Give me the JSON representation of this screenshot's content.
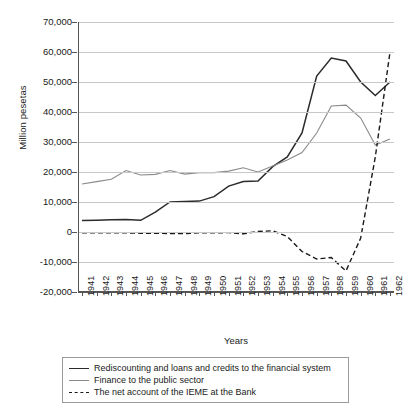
{
  "chart_data": {
    "type": "line",
    "title": "",
    "xlabel": "Years",
    "ylabel": "Million pesetas",
    "ylim": [
      -20000,
      70000
    ],
    "ytick_step": 10000,
    "grid": true,
    "legend_position": "bottom",
    "yticks": [
      "70,000",
      "60,000",
      "50,000",
      "40,000",
      "30,000",
      "20,000",
      "10,000",
      "0",
      "-10,000",
      "-20,000"
    ],
    "ytick_values": [
      70000,
      60000,
      50000,
      40000,
      30000,
      20000,
      10000,
      0,
      -10000,
      -20000
    ],
    "categories": [
      "1941",
      "1942",
      "1943",
      "1944",
      "1945",
      "1946",
      "1947",
      "1948",
      "1949",
      "1950",
      "1951",
      "1952",
      "1953",
      "1954",
      "1955",
      "1956",
      "1957",
      "1958",
      "1959",
      "1960",
      "1961",
      "1962"
    ],
    "series": [
      {
        "name": "Rediscounting and loans and credits to the financial system",
        "color": "#2b2b2b",
        "style": "solid",
        "values": [
          3800,
          3900,
          4100,
          4200,
          3900,
          6600,
          10000,
          10200,
          10300,
          11800,
          15300,
          16800,
          17000,
          21800,
          25000,
          33000,
          52000,
          58000,
          57000,
          50000,
          45500,
          50000
        ]
      },
      {
        "name": "Finance to the public sector",
        "color": "#8a8a8a",
        "style": "solid",
        "values": [
          16000,
          16800,
          17600,
          20500,
          19000,
          19200,
          20500,
          19300,
          19800,
          19800,
          20300,
          21400,
          20000,
          22000,
          24000,
          26500,
          33000,
          42000,
          42300,
          38000,
          29000,
          31000
        ]
      },
      {
        "name": "The net account of the IEME at the Bank",
        "color": "#1a1a1a",
        "style": "dashed",
        "values": [
          -300,
          -300,
          -300,
          -300,
          -400,
          -400,
          -500,
          -500,
          -300,
          -300,
          -200,
          -600,
          200,
          400,
          -1500,
          -6500,
          -9000,
          -8500,
          -13000,
          -2000,
          25000,
          60000
        ]
      }
    ]
  },
  "legend": {
    "items": [
      {
        "label": "Rediscounting and loans and credits to the financial system",
        "style": "solid-dark"
      },
      {
        "label": "Finance to the public sector",
        "style": "solid-grey"
      },
      {
        "label": "The net account of the IEME at the Bank",
        "style": "dashed"
      }
    ]
  }
}
